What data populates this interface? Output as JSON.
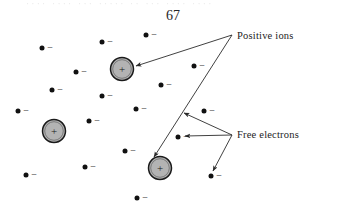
{
  "page": {
    "number": "67",
    "bleed_through_text": "···· ···· ··· ····· ·· ··· ···· ····",
    "background_color": "#ffffff"
  },
  "figure": {
    "name": "positive-ions-and-free-electrons-diagram",
    "width": 346,
    "height": 219,
    "ion_symbol": "+",
    "electron_symbol": "−",
    "colors": {
      "ion_fill": "#b3b3b3",
      "ion_stroke": "#1a1a1a",
      "electron_fill": "#111111",
      "line_stroke": "#2b2b2b",
      "text": "#1c1c1c"
    },
    "labels": [
      {
        "id": "positive-ions",
        "text": "Positive ions",
        "anchor_x": 232,
        "anchor_y": 35
      },
      {
        "id": "free-electrons",
        "text": "Free electrons",
        "anchor_x": 232,
        "anchor_y": 135
      }
    ],
    "ions": [
      {
        "id": "ion-1",
        "cx": 122,
        "cy": 69,
        "r": 11.5
      },
      {
        "id": "ion-2",
        "cx": 54,
        "cy": 131,
        "r": 11.5
      },
      {
        "id": "ion-3",
        "cx": 160,
        "cy": 168,
        "r": 11.5
      }
    ],
    "electrons": [
      {
        "id": "electron-1",
        "cx": 42,
        "cy": 48
      },
      {
        "id": "electron-2",
        "cx": 102,
        "cy": 42
      },
      {
        "id": "electron-3",
        "cx": 146,
        "cy": 35
      },
      {
        "id": "electron-4",
        "cx": 76,
        "cy": 72
      },
      {
        "id": "electron-5",
        "cx": 194,
        "cy": 66
      },
      {
        "id": "electron-6",
        "cx": 52,
        "cy": 90
      },
      {
        "id": "electron-7",
        "cx": 161,
        "cy": 85
      },
      {
        "id": "electron-8",
        "cx": 102,
        "cy": 96
      },
      {
        "id": "electron-9",
        "cx": 18,
        "cy": 111
      },
      {
        "id": "electron-10",
        "cx": 136,
        "cy": 109
      },
      {
        "id": "electron-11",
        "cx": 89,
        "cy": 121
      },
      {
        "id": "electron-12",
        "cx": 204,
        "cy": 111
      },
      {
        "id": "electron-13",
        "cx": 125,
        "cy": 151
      },
      {
        "id": "electron-14",
        "cx": 178,
        "cy": 137
      },
      {
        "id": "electron-15",
        "cx": 85,
        "cy": 167
      },
      {
        "id": "electron-16",
        "cx": 26,
        "cy": 175
      },
      {
        "id": "electron-17",
        "cx": 211,
        "cy": 176
      },
      {
        "id": "electron-18",
        "cx": 137,
        "cy": 198
      }
    ],
    "leader_lines": [
      {
        "id": "leader-positive-ion-top",
        "from_label": "positive-ions",
        "points": "232,35 136,66",
        "arrow_at": "end"
      },
      {
        "id": "leader-positive-ion-bottom",
        "from_label": "positive-ions",
        "points": "232,35 154,157",
        "arrow_at": "end"
      },
      {
        "id": "leader-free-electron-upper",
        "from_label": "free-electrons",
        "points": "232,135 184,113",
        "arrow_at": "end"
      },
      {
        "id": "leader-free-electron-middle",
        "from_label": "free-electrons",
        "points": "232,135 185,136",
        "arrow_at": "end"
      },
      {
        "id": "leader-free-electron-lower",
        "from_label": "free-electrons",
        "points": "232,135 213,171",
        "arrow_at": "end"
      }
    ]
  }
}
